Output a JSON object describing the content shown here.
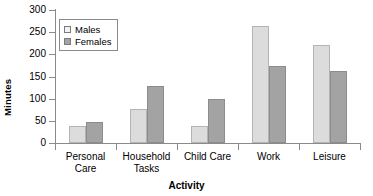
{
  "chart_data": {
    "type": "bar",
    "title": "",
    "xlabel": "Activity",
    "ylabel": "Minutes",
    "categories": [
      "Personal Care",
      "Household Tasks",
      "Child Care",
      "Work",
      "Leisure"
    ],
    "series": [
      {
        "name": "Males",
        "color": "#dcdcdc",
        "values": [
          38,
          77,
          38,
          265,
          220
        ]
      },
      {
        "name": "Females",
        "color": "#a3a3a3",
        "values": [
          47,
          129,
          100,
          174,
          162
        ]
      }
    ],
    "ylim": [
      0,
      300
    ],
    "yticks": [
      0,
      50,
      100,
      150,
      200,
      250,
      300
    ],
    "ytick_labels": [
      "0",
      "50",
      "100",
      "150",
      "200",
      "250",
      "300"
    ],
    "grid": false,
    "legend_position": "upper-left-inside"
  },
  "category_lines": [
    [
      "Personal",
      "Care"
    ],
    [
      "Household",
      "Tasks"
    ],
    [
      "Child Care",
      ""
    ],
    [
      "Work",
      ""
    ],
    [
      "Leisure",
      ""
    ]
  ]
}
